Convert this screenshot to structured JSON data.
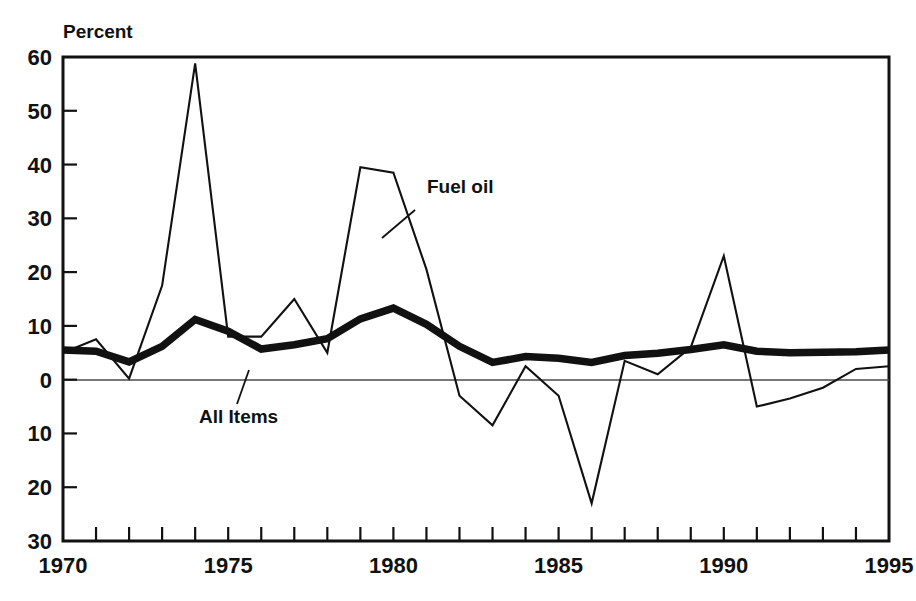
{
  "chart_data": {
    "type": "line",
    "title": "",
    "ylabel": "Percent",
    "xlabel": "",
    "ylim": [
      -30,
      60
    ],
    "xlim": [
      1970,
      1995
    ],
    "grid": false,
    "legend_position": "inline-annotation",
    "y_ticks": [
      60,
      50,
      40,
      30,
      20,
      10,
      0,
      -10,
      -20,
      -30
    ],
    "y_tick_labels": [
      "60",
      "50",
      "40",
      "30",
      "20",
      "10",
      "0",
      "10",
      "20",
      "30"
    ],
    "x_ticks": [
      1970,
      1971,
      1972,
      1973,
      1974,
      1975,
      1976,
      1977,
      1978,
      1979,
      1980,
      1981,
      1982,
      1983,
      1984,
      1985,
      1986,
      1987,
      1988,
      1989,
      1990,
      1991,
      1992,
      1993,
      1994,
      1995
    ],
    "x_tick_labels_shown": [
      "1970",
      "1975",
      "1980",
      "1985",
      "1990",
      "1995"
    ],
    "x": [
      1970,
      1971,
      1972,
      1973,
      1974,
      1975,
      1976,
      1977,
      1978,
      1979,
      1980,
      1981,
      1982,
      1983,
      1984,
      1985,
      1986,
      1987,
      1988,
      1989,
      1990,
      1991,
      1992,
      1993,
      1994,
      1995
    ],
    "series": [
      {
        "name": "Fuel oil",
        "style": "thin",
        "color": "#111111",
        "values": [
          5.0,
          7.5,
          0.2,
          17.5,
          58.8,
          8.0,
          8.0,
          15.0,
          5.0,
          39.5,
          38.5,
          20.5,
          -3.0,
          -8.5,
          2.5,
          -3.0,
          -23.0,
          3.5,
          1.0,
          6.0,
          23.0,
          -5.0,
          -3.5,
          -1.5,
          2.0,
          2.5
        ]
      },
      {
        "name": "All Items",
        "style": "thick",
        "color": "#111111",
        "values": [
          5.5,
          5.3,
          3.3,
          6.2,
          11.2,
          9.0,
          5.7,
          6.5,
          7.6,
          11.3,
          13.3,
          10.3,
          6.2,
          3.2,
          4.3,
          4.0,
          3.2,
          4.5,
          4.9,
          5.6,
          6.5,
          5.3,
          5.0,
          5.1,
          5.2,
          5.5
        ]
      }
    ],
    "annotations": [
      {
        "text": "Fuel oil",
        "x_px": 427,
        "y_px": 193
      },
      {
        "text": "All Items",
        "x_px": 199,
        "y_px": 423
      }
    ]
  }
}
